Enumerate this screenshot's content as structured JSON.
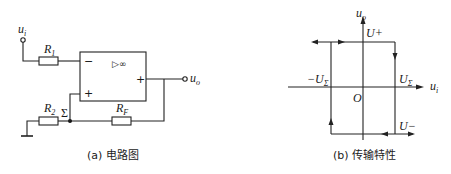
{
  "circuit": {
    "input_label": "u",
    "input_sub": "i",
    "output_label": "u",
    "output_sub": "o",
    "r1_label": "R",
    "r1_sub": "1",
    "r2_label": "R",
    "r2_sub": "2",
    "rf_label": "R",
    "rf_sub": "F",
    "sigma_label": "Σ",
    "opamp_symbol": "▷∞",
    "inverting_sign": "−",
    "noninverting_sign": "+",
    "output_sign": "+",
    "caption": "(a) 电路图"
  },
  "transfer": {
    "y_axis_label": "u",
    "y_axis_sub": "o",
    "x_axis_label": "u",
    "x_axis_sub": "i",
    "origin_label": "O",
    "u_plus_label": "U+",
    "u_minus_label": "U−",
    "pos_threshold_label": "U",
    "pos_threshold_sub": "Σ",
    "neg_threshold_label": "−U",
    "neg_threshold_sub": "Σ",
    "caption": "(b) 传输特性"
  }
}
